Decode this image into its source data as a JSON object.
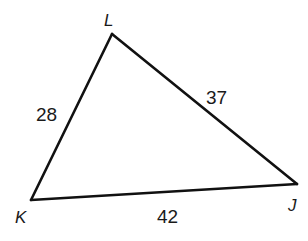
{
  "diagram": {
    "type": "triangle",
    "colors": {
      "stroke": "#111111",
      "text": "#1a1a1a",
      "background": "#ffffff"
    },
    "vertices": {
      "L": {
        "label": "L",
        "x": 112,
        "y": 34
      },
      "K": {
        "label": "K",
        "x": 31,
        "y": 200
      },
      "J": {
        "label": "J",
        "x": 297,
        "y": 184
      }
    },
    "sides": {
      "KL": {
        "label": "28"
      },
      "LJ": {
        "label": "37"
      },
      "KJ": {
        "label": "42"
      }
    }
  }
}
